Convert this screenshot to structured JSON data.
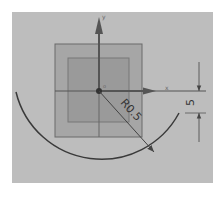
{
  "sketch": {
    "colors": {
      "background": "#ffffff",
      "canvas": "#bdbdbd",
      "outer_square_fill": "#a6a6a6",
      "inner_square_fill": "#9a9a9a",
      "geometry_stroke": "#555555",
      "arc_stroke": "#3a3a3a",
      "axis_stroke": "#555555",
      "dimension_stroke": "#444444"
    },
    "axes": {
      "x_label": "x",
      "y_label": "y",
      "origin_label": "o"
    },
    "radius_dimension": {
      "label": "R0.5"
    },
    "linear_dimension": {
      "label": "5"
    }
  }
}
